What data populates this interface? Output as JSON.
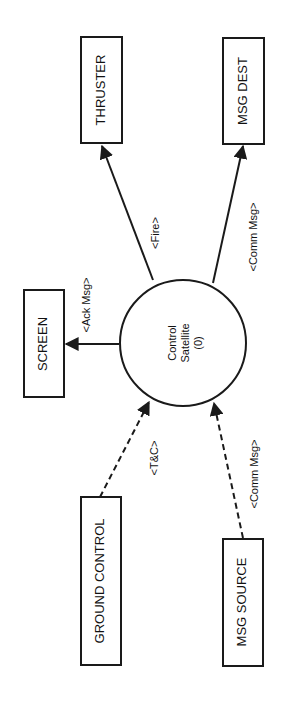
{
  "diagram": {
    "type": "data-flow-context-diagram",
    "orientation": "rotated-90-ccw",
    "colors": {
      "stroke": "#1a1a1a",
      "text": "#111111",
      "background": "#ffffff"
    },
    "process": {
      "line1": "Control",
      "line2": "Satellite",
      "line3": "(0)"
    },
    "entities": {
      "thruster": "THRUSTER",
      "msg_dest": "MSG DEST",
      "screen": "SCREEN",
      "ground_control": "GROUND CONTROL",
      "msg_source": "MSG SOURCE"
    },
    "flows": {
      "fire": {
        "label": "<Fire>",
        "from": "Control Satellite",
        "to": "THRUSTER",
        "style": "solid"
      },
      "comm_out": {
        "label": "<Comm Msg>",
        "from": "Control Satellite",
        "to": "MSG DEST",
        "style": "solid"
      },
      "ack": {
        "label": "<Ack Msg>",
        "from": "Control Satellite",
        "to": "SCREEN",
        "style": "solid"
      },
      "tc": {
        "label": "<T&C>",
        "from": "GROUND CONTROL",
        "to": "Control Satellite",
        "style": "dashed"
      },
      "comm_in": {
        "label": "<Comm Msg>",
        "from": "MSG SOURCE",
        "to": "Control Satellite",
        "style": "dashed"
      }
    }
  }
}
